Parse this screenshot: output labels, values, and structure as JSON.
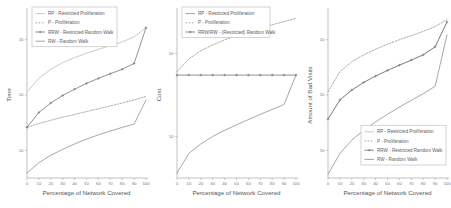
{
  "figure": {
    "panel_count": 3,
    "shared_xlabel": "Percentage of Network Covered"
  },
  "chart_data": [
    {
      "id": "time-panel",
      "type": "line",
      "title": "",
      "xlabel": "Percentage of Network Covered",
      "ylabel": "Time",
      "xlim": [
        0,
        100
      ],
      "ylim": [
        0,
        1
      ],
      "xticks": [
        "0",
        "10",
        "20",
        "30",
        "40",
        "50",
        "60",
        "70",
        "80",
        "90",
        "100"
      ],
      "yticks": [
        "10",
        "10",
        "10"
      ],
      "yscale": "log",
      "grid": false,
      "legend_position": "top-left",
      "legend": [
        "RP - Restricted Proliferation",
        "P - Proliferation",
        "RRW - Restricted Random Walk",
        "RW - Random Walk"
      ],
      "x": [
        0,
        10,
        20,
        30,
        40,
        50,
        60,
        70,
        80,
        90,
        100
      ],
      "series": [
        {
          "name": "RP - Restricted Proliferation",
          "style": "solid-light",
          "values": [
            0.52,
            0.6,
            0.655,
            0.695,
            0.725,
            0.752,
            0.775,
            0.797,
            0.82,
            0.85,
            0.905
          ]
        },
        {
          "name": "P - Proliferation",
          "style": "dotted",
          "values": [
            0.305,
            0.328,
            0.348,
            0.366,
            0.383,
            0.4,
            0.417,
            0.434,
            0.452,
            0.47,
            0.492
          ]
        },
        {
          "name": "RRW - Restricted Random Walk",
          "style": "solid-marked",
          "values": [
            0.305,
            0.395,
            0.452,
            0.497,
            0.535,
            0.57,
            0.6,
            0.628,
            0.655,
            0.69,
            0.905
          ]
        },
        {
          "name": "RW - Random Walk",
          "style": "solid",
          "values": [
            0.03,
            0.092,
            0.137,
            0.173,
            0.205,
            0.234,
            0.26,
            0.283,
            0.305,
            0.325,
            0.47
          ]
        }
      ]
    },
    {
      "id": "cost-panel",
      "type": "line",
      "title": "",
      "xlabel": "Percentage of Network Covered",
      "ylabel": "Cost",
      "xlim": [
        0,
        100
      ],
      "ylim": [
        0,
        1
      ],
      "xticks": [
        "0",
        "10",
        "20",
        "30",
        "40",
        "50",
        "60",
        "70",
        "80",
        "90",
        "100"
      ],
      "yticks": [
        "10",
        "10"
      ],
      "yscale": "log",
      "grid": false,
      "legend_position": "top-left",
      "legend": [
        "RP - Restricted Proliferation",
        "P - Proliferation",
        "RRW/RW - (Restricted) Random Walk"
      ],
      "x": [
        0,
        10,
        20,
        30,
        40,
        50,
        60,
        70,
        80,
        90,
        100
      ],
      "series": [
        {
          "name": "RP - Restricted Proliferation",
          "style": "solid",
          "values": [
            0.03,
            0.148,
            0.205,
            0.25,
            0.287,
            0.32,
            0.352,
            0.383,
            0.413,
            0.443,
            0.62
          ]
        },
        {
          "name": "P - Proliferation",
          "style": "dotted",
          "values": [
            0.64,
            0.718,
            0.766,
            0.802,
            0.832,
            0.858,
            0.882,
            0.903,
            0.923,
            0.942,
            0.962
          ]
        },
        {
          "name": "RRW/RW - (Restricted) Random Walk",
          "style": "solid-marked-flat",
          "values": [
            0.62,
            0.62,
            0.62,
            0.62,
            0.62,
            0.62,
            0.62,
            0.62,
            0.62,
            0.62,
            0.62
          ]
        }
      ]
    },
    {
      "id": "bad-visits-panel",
      "type": "line",
      "title": "",
      "xlabel": "Percentage of Network Covered",
      "ylabel": "Amount of Bad Visits",
      "xlim": [
        0,
        100
      ],
      "ylim": [
        0,
        1
      ],
      "xticks": [
        "0",
        "10",
        "20",
        "30",
        "40",
        "50",
        "60",
        "70",
        "80",
        "90",
        "100"
      ],
      "yticks": [
        "10",
        "10",
        "10"
      ],
      "yscale": "log",
      "grid": false,
      "legend_position": "bottom-right",
      "legend": [
        "RP - Restricted Proliferation",
        "P - Proliferation",
        "RRW - Restricted Random Walk",
        "RW - Random Walk"
      ],
      "x": [
        0,
        10,
        20,
        30,
        40,
        50,
        60,
        70,
        80,
        90,
        100
      ],
      "series": [
        {
          "name": "RP - Restricted Proliferation",
          "style": "solid-light",
          "values": [
            0.355,
            0.47,
            0.53,
            0.576,
            0.614,
            0.648,
            0.68,
            0.71,
            0.742,
            0.79,
            0.94
          ]
        },
        {
          "name": "P - Proliferation",
          "style": "dotted",
          "values": [
            0.52,
            0.64,
            0.7,
            0.742,
            0.776,
            0.806,
            0.833,
            0.858,
            0.883,
            0.912,
            0.955
          ]
        },
        {
          "name": "RRW - Restricted Random Walk",
          "style": "solid-marked",
          "values": [
            0.355,
            0.47,
            0.53,
            0.576,
            0.614,
            0.648,
            0.68,
            0.71,
            0.742,
            0.79,
            0.94
          ]
        },
        {
          "name": "RW - Random Walk",
          "style": "solid",
          "values": [
            0.022,
            0.148,
            0.228,
            0.288,
            0.338,
            0.384,
            0.427,
            0.468,
            0.508,
            0.552,
            0.862
          ]
        }
      ]
    }
  ]
}
